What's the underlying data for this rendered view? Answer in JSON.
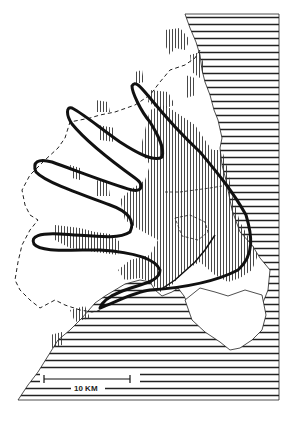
{
  "map": {
    "subject": "Finger Plan urban region map",
    "colors": {
      "background": "#ffffff",
      "ink": "#1a1a1a",
      "sea_hatch": "#222222",
      "urban_hatch": "#333333"
    },
    "legend_elements": [
      {
        "name": "sea",
        "pattern": "horizontal-hatching"
      },
      {
        "name": "urban-area",
        "pattern": "vertical-hatching"
      },
      {
        "name": "plan-outline",
        "pattern": "thick-solid-line"
      },
      {
        "name": "region-boundary",
        "pattern": "dashed-line"
      }
    ],
    "scale_bar": {
      "label": "10 KM"
    }
  }
}
